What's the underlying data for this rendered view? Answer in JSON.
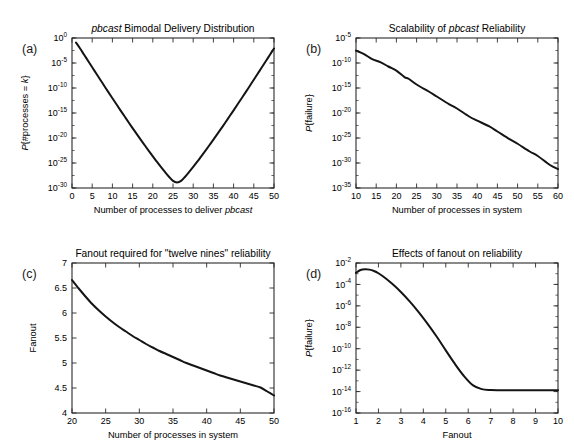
{
  "figure": {
    "background": "#ffffff",
    "line_color": "#141414",
    "axis_color": "#2b2b2b",
    "panels": [
      "(a)",
      "(b)",
      "(c)",
      "(d)"
    ]
  },
  "chart_data": [
    {
      "panel": "(a)",
      "type": "line",
      "title": "pbcast Bimodal Delivery Distribution",
      "title_italic_word": "pbcast",
      "xlabel": "Number of processes to deliver pbcast",
      "xlabel_italic_word": "pbcast",
      "ylabel": "P{#processes = k}",
      "xscale": "linear",
      "yscale": "log",
      "xlim": [
        0,
        50
      ],
      "ylim": [
        1e-30,
        1
      ],
      "xticks": [
        0,
        5,
        10,
        15,
        20,
        25,
        30,
        35,
        40,
        45,
        50
      ],
      "xticklabels": [
        "0",
        "5",
        "10",
        "15",
        "20",
        "25",
        "30",
        "35",
        "40",
        "45",
        "50"
      ],
      "yticks": [
        1,
        1e-05,
        1e-10,
        1e-15,
        1e-20,
        1e-25,
        1e-30
      ],
      "yticklabels": [
        "10^0",
        "10^-5",
        "10^-10",
        "10^-15",
        "10^-20",
        "10^-25",
        "10^-30"
      ],
      "grid": false,
      "legend": null,
      "x": [
        1,
        2,
        3,
        4,
        5,
        6,
        7,
        8,
        9,
        10,
        11,
        12,
        13,
        14,
        15,
        16,
        17,
        18,
        19,
        20,
        21,
        22,
        23,
        24,
        25,
        26,
        27,
        28,
        29,
        30,
        31,
        32,
        33,
        34,
        35,
        36,
        37,
        38,
        39,
        40,
        41,
        42,
        43,
        44,
        45,
        46,
        47,
        48,
        49,
        50
      ],
      "y": [
        0.12,
        0.008,
        0.00045,
        2.5e-05,
        1.4e-06,
        8e-08,
        4.5e-09,
        2.6e-10,
        1.5e-11,
        9e-13,
        5.5e-14,
        3.4e-15,
        2.2e-16,
        1.4e-17,
        9.5e-19,
        6.6e-20,
        4.7e-21,
        3.5e-22,
        2.7e-23,
        2.2e-24,
        1.8e-25,
        1.6e-26,
        1.6e-27,
        1.8e-28,
        2.6e-29,
        1.3e-29,
        2.6e-29,
        1.8e-28,
        1.6e-27,
        1.6e-26,
        1.8e-25,
        2.2e-24,
        2.7e-23,
        3.5e-22,
        4.7e-21,
        6.6e-20,
        9.5e-19,
        1.4e-17,
        2.2e-16,
        3.4e-15,
        5.5e-14,
        9e-13,
        1.5e-11,
        2.6e-10,
        4.5e-09,
        8e-08,
        1.4e-06,
        2.5e-05,
        0.00045,
        0.008
      ]
    },
    {
      "panel": "(b)",
      "type": "line",
      "title": "Scalability of pbcast Reliability",
      "title_italic_word": "pbcast",
      "xlabel": "Number of processes in system",
      "xlabel_italic_word": null,
      "ylabel": "P{failure}",
      "xscale": "linear",
      "yscale": "log",
      "xlim": [
        10,
        60
      ],
      "ylim": [
        1e-35,
        1e-05
      ],
      "xticks": [
        10,
        15,
        20,
        25,
        30,
        35,
        40,
        45,
        50,
        55,
        60
      ],
      "xticklabels": [
        "10",
        "15",
        "20",
        "25",
        "30",
        "35",
        "40",
        "45",
        "50",
        "55",
        "60"
      ],
      "yticks": [
        1e-05,
        1e-10,
        1e-15,
        1e-20,
        1e-25,
        1e-30,
        1e-35
      ],
      "yticklabels": [
        "10^-5",
        "10^-10",
        "10^-15",
        "10^-20",
        "10^-25",
        "10^-30",
        "10^-35"
      ],
      "grid": false,
      "legend": null,
      "x": [
        10,
        12,
        14,
        16,
        18,
        20,
        22,
        23,
        25,
        28,
        30,
        33,
        35,
        38,
        40,
        43,
        45,
        48,
        50,
        53,
        55,
        58,
        60
      ],
      "y": [
        3e-08,
        6e-09,
        6e-10,
        1.5e-10,
        2e-11,
        3e-12,
        1.5e-13,
        7e-14,
        5e-15,
        2e-16,
        2e-17,
        6e-19,
        8e-20,
        2e-21,
        3e-22,
        2e-23,
        2e-24,
        6e-26,
        7e-27,
        2e-28,
        2.5e-29,
        4e-31,
        6e-32
      ]
    },
    {
      "panel": "(c)",
      "type": "line",
      "title": "Fanout required for \"twelve nines\" reliability",
      "title_italic_word": null,
      "xlabel": "Number of processes in system",
      "xlabel_italic_word": null,
      "ylabel": "Fanout",
      "xscale": "linear",
      "yscale": "linear",
      "xlim": [
        20,
        50
      ],
      "ylim": [
        4,
        7
      ],
      "xticks": [
        20,
        25,
        30,
        35,
        40,
        45,
        50
      ],
      "xticklabels": [
        "20",
        "25",
        "30",
        "35",
        "40",
        "45",
        "50"
      ],
      "yticks": [
        4,
        4.5,
        5,
        5.5,
        6,
        6.5,
        7
      ],
      "yticklabels": [
        "4",
        "4.5",
        "5",
        "5.5",
        "6",
        "6.5",
        "7"
      ],
      "grid": false,
      "legend": null,
      "x": [
        20,
        21,
        22,
        23,
        24,
        25,
        26,
        27,
        28,
        29,
        30,
        31,
        32,
        33,
        34,
        35,
        36,
        37,
        38,
        39,
        40,
        41,
        42,
        43,
        44,
        45,
        46,
        47,
        48,
        49,
        50
      ],
      "y": [
        6.66,
        6.49,
        6.33,
        6.18,
        6.05,
        5.93,
        5.82,
        5.72,
        5.63,
        5.54,
        5.46,
        5.38,
        5.31,
        5.24,
        5.18,
        5.12,
        5.06,
        5.0,
        4.95,
        4.9,
        4.85,
        4.8,
        4.75,
        4.71,
        4.67,
        4.63,
        4.59,
        4.55,
        4.51,
        4.43,
        4.35
      ]
    },
    {
      "panel": "(d)",
      "type": "line",
      "title": "Effects of fanout on reliability",
      "title_italic_word": null,
      "xlabel": "Fanout",
      "xlabel_italic_word": null,
      "ylabel": "P{failure}",
      "xscale": "linear",
      "yscale": "log",
      "xlim": [
        1,
        10
      ],
      "ylim": [
        1e-16,
        0.01
      ],
      "xticks": [
        1,
        2,
        3,
        4,
        5,
        6,
        7,
        8,
        9,
        10
      ],
      "xticklabels": [
        "1",
        "2",
        "3",
        "4",
        "5",
        "6",
        "7",
        "8",
        "9",
        "10"
      ],
      "yticks": [
        0.01,
        0.0001,
        1e-06,
        1e-08,
        1e-10,
        1e-12,
        1e-14,
        1e-16
      ],
      "yticklabels": [
        "10^-2",
        "10^-4",
        "10^-6",
        "10^-8",
        "10^-10",
        "10^-12",
        "10^-14",
        "10^-16"
      ],
      "grid": false,
      "legend": null,
      "x": [
        1.0,
        1.2,
        1.4,
        1.6,
        1.8,
        2.0,
        2.3,
        2.6,
        3.0,
        3.4,
        3.8,
        4.2,
        4.6,
        5.0,
        5.4,
        5.8,
        6.2,
        6.6,
        7.0,
        7.4,
        7.8,
        8.2,
        8.6,
        9.0,
        9.5,
        10.0
      ],
      "y": [
        0.0012,
        0.0022,
        0.0026,
        0.0024,
        0.0018,
        0.0011,
        0.0004,
        0.00012,
        2e-05,
        2.5e-06,
        2.5e-07,
        2e-08,
        1.3e-09,
        7e-11,
        4e-12,
        3e-13,
        4e-14,
        1.7e-14,
        1.4e-14,
        1.35e-14,
        1.33e-14,
        1.32e-14,
        1.32e-14,
        1.32e-14,
        1.32e-14,
        1.32e-14
      ]
    }
  ]
}
